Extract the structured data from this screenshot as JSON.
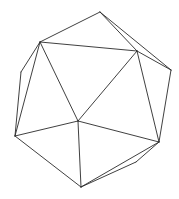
{
  "figure": {
    "stroke_color": "#2a2a2a",
    "background": "#ffffff",
    "vertices": {
      "top": [
        100,
        12
      ],
      "upper_left": [
        40,
        42
      ],
      "upper_right": [
        137,
        51
      ],
      "right": [
        171,
        70
      ],
      "left": [
        21,
        72
      ],
      "center": [
        78,
        121
      ],
      "bottom_left": [
        15,
        136
      ],
      "lower_right": [
        159,
        142
      ],
      "hidden_lower": [
        136,
        162
      ],
      "bottom": [
        81,
        187
      ]
    },
    "edges": [
      [
        "top",
        "upper_left"
      ],
      [
        "top",
        "upper_right"
      ],
      [
        "top",
        "right"
      ],
      [
        "upper_left",
        "upper_right"
      ],
      [
        "upper_left",
        "left"
      ],
      [
        "upper_left",
        "bottom_left"
      ],
      [
        "upper_left",
        "center"
      ],
      [
        "upper_right",
        "center"
      ],
      [
        "upper_right",
        "right"
      ],
      [
        "upper_right",
        "lower_right"
      ],
      [
        "right",
        "lower_right"
      ],
      [
        "left",
        "bottom_left"
      ],
      [
        "bottom_left",
        "center"
      ],
      [
        "bottom_left",
        "bottom"
      ],
      [
        "center",
        "bottom"
      ],
      [
        "center",
        "lower_right"
      ],
      [
        "lower_right",
        "bottom"
      ],
      [
        "lower_right",
        "hidden_lower"
      ],
      [
        "hidden_lower",
        "bottom"
      ]
    ]
  }
}
